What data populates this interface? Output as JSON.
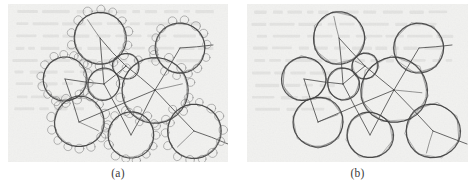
{
  "figure": {
    "background_color": "#ffffff",
    "paper_color": "#f2f2f0",
    "ink_color": "#4a4a4a",
    "ink_color_dark": "#2f2f2f",
    "ink_color_light": "#8d8d8d",
    "panels": [
      {
        "id": "panel-a",
        "caption": "(a)",
        "x": 8,
        "y": 4,
        "width": 220,
        "height": 158,
        "description": "Scanned line drawing: overlapping large circles connected by straight graph edges, each large circle encircled by a ring of small circles",
        "big_circles": [
          {
            "cx": 92,
            "cy": 34,
            "r": 26
          },
          {
            "cx": 57,
            "cy": 75,
            "r": 22
          },
          {
            "cx": 147,
            "cy": 86,
            "r": 33
          },
          {
            "cx": 172,
            "cy": 44,
            "r": 25
          },
          {
            "cx": 71,
            "cy": 118,
            "r": 25
          },
          {
            "cx": 123,
            "cy": 131,
            "r": 23
          },
          {
            "cx": 186,
            "cy": 127,
            "r": 27
          },
          {
            "cx": 96,
            "cy": 80,
            "r": 16
          },
          {
            "cx": 118,
            "cy": 62,
            "r": 13
          }
        ],
        "small_circle_radius": 4.2,
        "small_circles_per_ring": 14,
        "edges": [
          [
            92,
            34,
            96,
            80
          ],
          [
            92,
            34,
            118,
            62
          ],
          [
            57,
            75,
            96,
            80
          ],
          [
            96,
            80,
            118,
            62
          ],
          [
            118,
            62,
            147,
            86
          ],
          [
            147,
            86,
            172,
            44
          ],
          [
            147,
            86,
            186,
            127
          ],
          [
            147,
            86,
            123,
            131
          ],
          [
            147,
            86,
            71,
            118
          ],
          [
            172,
            44,
            205,
            41
          ],
          [
            123,
            131,
            96,
            80
          ],
          [
            71,
            118,
            57,
            75
          ],
          [
            186,
            127,
            220,
            140
          ]
        ]
      },
      {
        "id": "panel-b",
        "caption": "(b)",
        "x": 247,
        "y": 4,
        "width": 221,
        "height": 158,
        "description": "Scanned line drawing: same circle layout with inscribed polygonal approximations (heptagons/octagons) drawn over the circles",
        "big_circles": [
          {
            "cx": 92,
            "cy": 34,
            "r": 26
          },
          {
            "cx": 57,
            "cy": 75,
            "r": 22
          },
          {
            "cx": 147,
            "cy": 86,
            "r": 33
          },
          {
            "cx": 172,
            "cy": 44,
            "r": 25
          },
          {
            "cx": 71,
            "cy": 118,
            "r": 25
          },
          {
            "cx": 123,
            "cy": 131,
            "r": 23
          },
          {
            "cx": 186,
            "cy": 127,
            "r": 27
          },
          {
            "cx": 96,
            "cy": 80,
            "r": 16
          },
          {
            "cx": 118,
            "cy": 62,
            "r": 13
          }
        ],
        "polygon_sides": 7,
        "edges": [
          [
            92,
            34,
            96,
            80
          ],
          [
            92,
            34,
            118,
            62
          ],
          [
            57,
            75,
            96,
            80
          ],
          [
            96,
            80,
            118,
            62
          ],
          [
            118,
            62,
            147,
            86
          ],
          [
            147,
            86,
            172,
            44
          ],
          [
            147,
            86,
            186,
            127
          ],
          [
            147,
            86,
            123,
            131
          ],
          [
            147,
            86,
            71,
            118
          ],
          [
            172,
            44,
            205,
            41
          ],
          [
            123,
            131,
            96,
            80
          ],
          [
            71,
            118,
            57,
            75
          ],
          [
            186,
            127,
            220,
            140
          ]
        ]
      }
    ]
  }
}
